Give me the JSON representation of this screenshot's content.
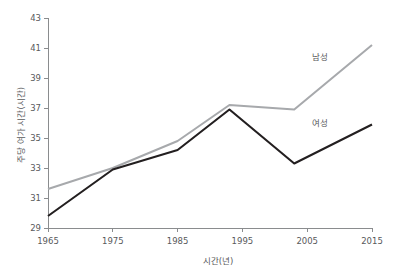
{
  "chart_data": {
    "type": "line",
    "title": "",
    "xlabel": "시간(년)",
    "ylabel": "주당 여가 시간(시간)",
    "x": [
      1965,
      1975,
      1985,
      1993,
      2003,
      2015
    ],
    "xlim": [
      1965,
      2015
    ],
    "ylim": [
      29,
      43
    ],
    "xticks": [
      "1965",
      "1975",
      "1985",
      "1995",
      "2005",
      "2015"
    ],
    "xtick_values": [
      1965,
      1975,
      1985,
      1995,
      2005,
      2015
    ],
    "yticks": [
      "29",
      "31",
      "33",
      "35",
      "37",
      "39",
      "41",
      "43"
    ],
    "ytick_values": [
      29,
      31,
      33,
      35,
      37,
      39,
      41,
      43
    ],
    "grid": false,
    "legend_position": "inline-right",
    "series": [
      {
        "name": "남성",
        "color": "#a7a9ac",
        "values": [
          31.6,
          33.0,
          34.8,
          37.2,
          36.9,
          41.2
        ],
        "label_x": 2007,
        "label_y": 40.2
      },
      {
        "name": "여성",
        "color": "#231f20",
        "values": [
          29.8,
          32.9,
          34.2,
          36.9,
          33.3,
          35.9
        ],
        "label_x": 2007,
        "label_y": 35.8
      }
    ]
  },
  "axis": {
    "color": "#8a8c8e",
    "text_color": "#58595b"
  }
}
